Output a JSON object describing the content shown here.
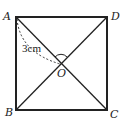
{
  "diagram": {
    "type": "geometry-square-diagonals",
    "points": {
      "A": {
        "label": "A",
        "x": 16,
        "y": 17
      },
      "D": {
        "label": "D",
        "x": 107,
        "y": 17
      },
      "B": {
        "label": "B",
        "x": 16,
        "y": 110
      },
      "C": {
        "label": "C",
        "x": 107,
        "y": 110
      },
      "O": {
        "label": "O",
        "x": 61,
        "y": 63
      }
    },
    "measurement": {
      "label": "3cm",
      "segment": "AO"
    },
    "angle_mark": {
      "at": "O",
      "between": [
        "OA",
        "OD"
      ]
    },
    "colors": {
      "stroke": "#222222",
      "background": "#ffffff"
    }
  }
}
